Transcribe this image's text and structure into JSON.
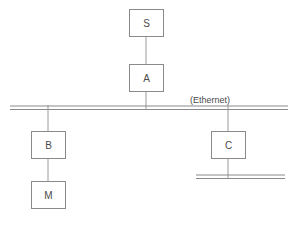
{
  "diagram": {
    "type": "network-topology",
    "title": "",
    "background_color": "#ffffff",
    "stroke_color": "#8a8a8a",
    "link_color": "#9a9a9a",
    "text_color": "#4a4a4a",
    "nodes": [
      {
        "id": "S",
        "label": "S",
        "x": 146,
        "y": 23,
        "w": 34,
        "h": 27
      },
      {
        "id": "A",
        "label": "A",
        "x": 146,
        "y": 78,
        "w": 34,
        "h": 27
      },
      {
        "id": "B",
        "label": "B",
        "x": 48,
        "y": 145,
        "w": 34,
        "h": 27
      },
      {
        "id": "M",
        "label": "M",
        "x": 48,
        "y": 195,
        "w": 34,
        "h": 27
      },
      {
        "id": "C",
        "label": "C",
        "x": 228,
        "y": 145,
        "w": 34,
        "h": 27
      }
    ],
    "buses": [
      {
        "id": "ethernet-main",
        "label": "(Ethernet)",
        "x1": 10,
        "x2": 288,
        "y": 107,
        "gap": 3
      },
      {
        "id": "segment-lower-right",
        "label": "",
        "x1": 196,
        "x2": 285,
        "y": 176,
        "gap": 3
      }
    ],
    "bus_labels": [
      {
        "for": "ethernet-main",
        "text": "(Ethernet)",
        "x": 190,
        "y": 103
      }
    ],
    "links": [
      {
        "from": "S",
        "to": "A",
        "x": 146,
        "y1": 37,
        "y2": 65
      },
      {
        "from": "A",
        "to": "ethernet-main",
        "x": 146,
        "y1": 92,
        "y2": 110
      },
      {
        "from": "ethernet-main",
        "to": "B",
        "x": 48,
        "y1": 105,
        "y2": 132
      },
      {
        "from": "B",
        "to": "M",
        "x": 48,
        "y1": 158,
        "y2": 182
      },
      {
        "from": "ethernet-main",
        "to": "C",
        "x": 228,
        "y1": 105,
        "y2": 132
      },
      {
        "from": "C",
        "to": "segment-lower-right",
        "x": 228,
        "y1": 158,
        "y2": 179
      }
    ]
  }
}
